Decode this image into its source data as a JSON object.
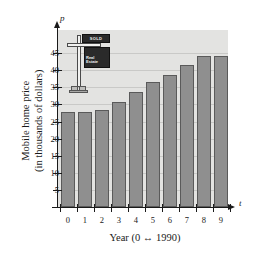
{
  "chart_data": {
    "type": "bar",
    "title": "",
    "xlabel": "Year (0 ↔ 1990)",
    "ylabel": "Mobile home price (in thousands of dollars)",
    "x_axis_variable": "t",
    "y_axis_variable": "p",
    "categories": [
      "0",
      "1",
      "2",
      "3",
      "4",
      "5",
      "6",
      "7",
      "8",
      "9"
    ],
    "values": [
      27.8,
      27.8,
      28.5,
      30.6,
      33.7,
      36.5,
      38.5,
      41.5,
      44.2,
      44.2
    ],
    "xlim": [
      -0.6,
      9.9
    ],
    "ylim": [
      0,
      47
    ],
    "y_ticks": [
      "5",
      "10",
      "15",
      "20",
      "25",
      "30",
      "35",
      "40",
      "45"
    ],
    "y_tick_values": [
      5,
      10,
      15,
      20,
      25,
      30,
      35,
      40,
      45
    ],
    "grid": true,
    "legend": "none",
    "bar_color": "#8f8f8f",
    "bar_edge_color": "#5a5a5a",
    "plot_background_color": "#e3e3e1",
    "gridline_color": "#c9c9c7",
    "axis_color": "#1a1a1a"
  },
  "ylabel_lines": {
    "line1": "Mobile home price",
    "line2": "(in thousands of dollars)"
  },
  "illustration": {
    "name": "real-estate-sign",
    "sold_label": "SOLD",
    "brand_line1": "Real",
    "brand_line2": "Estate",
    "post_color": "#f2f2f0",
    "plate_color": "#2a2a2a",
    "text_color": "#f0f0f0"
  }
}
